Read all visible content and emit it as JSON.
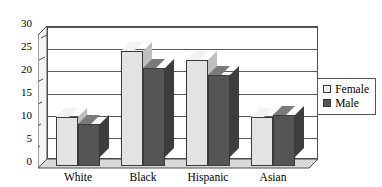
{
  "chart_data": {
    "type": "bar",
    "title": "",
    "subtitle": "",
    "xlabel": "",
    "ylabel": "",
    "categories": [
      "White",
      "Black",
      "Hispanic",
      "Asian"
    ],
    "series": [
      {
        "name": "Female",
        "color": "#e3e3e3",
        "values": [
          11,
          26,
          24,
          11
        ]
      },
      {
        "name": "Male",
        "color": "#555555",
        "values": [
          9.5,
          22,
          20.5,
          11.5
        ]
      }
    ],
    "ylim": [
      0,
      30
    ],
    "ytick_step": 5,
    "yticks": [
      0,
      5,
      10,
      15,
      20,
      25,
      30
    ],
    "ytick_labels": [
      "0",
      "5",
      "10",
      "15",
      "20",
      "25",
      "30"
    ],
    "grid": true,
    "grid_axis": "y",
    "legend": {
      "position": "right",
      "entries": [
        "Female",
        "Male"
      ]
    },
    "style": "3d-column"
  },
  "axes": {
    "y_tick_labels": [
      "30",
      "25",
      "20",
      "15",
      "10",
      "5",
      "0"
    ],
    "x_tick_labels": [
      "White",
      "Black",
      "Hispanic",
      "Asian"
    ]
  },
  "legend": {
    "items": [
      {
        "label": "Female",
        "swatch": "legend-swatch-female"
      },
      {
        "label": "Male",
        "swatch": "legend-swatch-male"
      }
    ]
  },
  "colors": {
    "female_fill": "#e3e3e3",
    "male_fill": "#555555",
    "axis": "#4d4d4d",
    "grid": "#5a5a5a",
    "background": "#ffffff"
  }
}
